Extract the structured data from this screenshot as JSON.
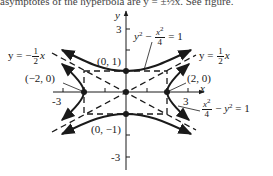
{
  "header_cut_text": "asymptotes of the hyperbola are y = ±½x. See figure.",
  "axes": {
    "x_label": "x",
    "y_label": "y",
    "x_ticks": [
      "-3",
      "3"
    ],
    "y_ticks": [
      "3",
      "-3"
    ]
  },
  "points": [
    {
      "label": "(0, 1)",
      "x": 0,
      "y": 1
    },
    {
      "label": "(0, −1)",
      "x": 0,
      "y": -1
    },
    {
      "label": "(−2, 0)",
      "x": -2,
      "y": 0
    },
    {
      "label": "(2, 0)",
      "x": 2,
      "y": 0
    }
  ],
  "equations": {
    "hyperbola_vertical": {
      "lhs_var": "y",
      "lhs_exp": "2",
      "minus": "−",
      "num": "x",
      "num_exp": "2",
      "den": "4",
      "rhs": "= 1"
    },
    "hyperbola_horizontal": {
      "num": "x",
      "num_exp": "2",
      "den": "4",
      "minus": "−",
      "var": "y",
      "var_exp": "2",
      "rhs": "= 1"
    },
    "asymptote_neg": {
      "prefix": "y = −",
      "num": "1",
      "den": "2",
      "var": "x"
    },
    "asymptote_pos": {
      "prefix": "y = ",
      "num": "1",
      "den": "2",
      "var": "x"
    }
  },
  "colors": {
    "ink": "#1a1a1a",
    "background": "#ffffff"
  }
}
